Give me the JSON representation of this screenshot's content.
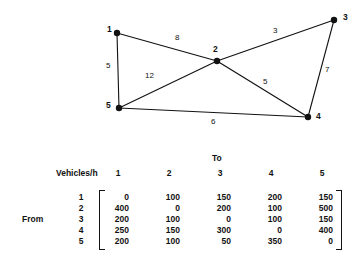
{
  "diagram": {
    "type": "network-graph",
    "nodes": [
      {
        "id": "1",
        "label": "1",
        "x": 117,
        "y": 33,
        "label_x": 107,
        "label_y": 25
      },
      {
        "id": "2",
        "label": "2",
        "x": 217,
        "y": 61,
        "label_x": 213,
        "label_y": 45
      },
      {
        "id": "3",
        "label": "3",
        "x": 334,
        "y": 20,
        "label_x": 343,
        "label_y": 13
      },
      {
        "id": "4",
        "label": "4",
        "x": 308,
        "y": 117,
        "label_x": 316,
        "label_y": 112
      },
      {
        "id": "5",
        "label": "5",
        "x": 119,
        "y": 108,
        "label_x": 106,
        "label_y": 101
      }
    ],
    "edges": [
      {
        "from": "1",
        "to": "2",
        "weight": "8",
        "label_x": 175,
        "label_y": 34
      },
      {
        "from": "1",
        "to": "5",
        "weight": "5",
        "label_x": 106,
        "label_y": 62
      },
      {
        "from": "2",
        "to": "3",
        "weight": "3",
        "label_x": 273,
        "label_y": 27
      },
      {
        "from": "2",
        "to": "4",
        "weight": "5",
        "label_x": 263,
        "label_y": 78
      },
      {
        "from": "2",
        "to": "5",
        "weight": "12",
        "label_x": 145,
        "label_y": 72
      },
      {
        "from": "3",
        "to": "4",
        "weight": "7",
        "label_x": 325,
        "label_y": 66
      },
      {
        "from": "4",
        "to": "5",
        "weight": "6",
        "label_x": 211,
        "label_y": 118
      }
    ],
    "node_radius": 3.2,
    "edge_color": "#111111",
    "node_color": "#111111"
  },
  "matrix": {
    "to_header": "To",
    "from_header": "From",
    "corner_header": "Vehicles/h",
    "col_headers": [
      "1",
      "2",
      "3",
      "4",
      "5"
    ],
    "row_headers": [
      "1",
      "2",
      "3",
      "4",
      "5"
    ],
    "rows": [
      [
        "0",
        "100",
        "150",
        "200",
        "150"
      ],
      [
        "400",
        "0",
        "200",
        "100",
        "500"
      ],
      [
        "200",
        "100",
        "0",
        "100",
        "150"
      ],
      [
        "250",
        "150",
        "300",
        "0",
        "400"
      ],
      [
        "200",
        "100",
        "50",
        "350",
        "0"
      ]
    ]
  }
}
